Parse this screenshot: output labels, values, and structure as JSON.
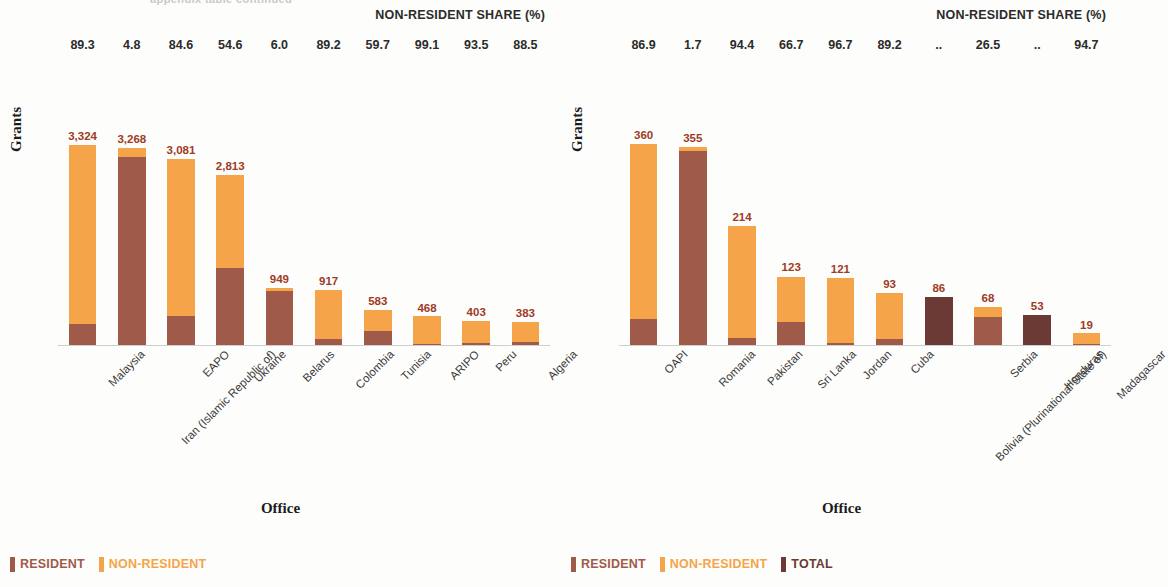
{
  "page": {
    "cutoff_text": "appendix table continued",
    "background": "#fdfdfb"
  },
  "colors": {
    "non_resident": "#f5a44a",
    "resident": "#a05a4a",
    "total": "#6b3a35",
    "value_label": "#9e3b26",
    "header_text": "#2b2b2b",
    "axis_title": "#1c1c1c"
  },
  "charts": [
    {
      "id": "left",
      "share_header": "NON-RESIDENT SHARE (%)",
      "ylabel": "Grants",
      "xlabel": "Office",
      "ymax": 3400,
      "legend": [
        {
          "label": "RESIDENT",
          "color": "#a05a4a"
        },
        {
          "label": "NON-RESIDENT",
          "color": "#f5a44a"
        }
      ],
      "categories": [
        "Malaysia",
        "Iran (Islamic Republic of)",
        "EAPO",
        "Ukraine",
        "Belarus",
        "Colombia",
        "Tunisia",
        "ARIPO",
        "Peru",
        "Algeria"
      ],
      "total_labels": [
        "3,324",
        "3,268",
        "3,081",
        "2,813",
        "949",
        "917",
        "583",
        "468",
        "403",
        "383"
      ],
      "totals": [
        3324,
        3268,
        3081,
        2813,
        949,
        917,
        583,
        468,
        403,
        383
      ],
      "non_resident_share": [
        "89.3",
        "4.8",
        "84.6",
        "54.6",
        "6.0",
        "89.2",
        "59.7",
        "99.1",
        "93.5",
        "88.5"
      ],
      "non_resident": [
        2968,
        157,
        2607,
        1536,
        57,
        818,
        348,
        464,
        377,
        339
      ],
      "resident": [
        356,
        3111,
        474,
        1277,
        892,
        99,
        235,
        4,
        26,
        44
      ],
      "total_only": [
        0,
        0,
        0,
        0,
        0,
        0,
        0,
        0,
        0,
        0
      ]
    },
    {
      "id": "right",
      "share_header": "NON-RESIDENT SHARE (%)",
      "ylabel": "Grants",
      "xlabel": "Office",
      "ymax": 368,
      "legend": [
        {
          "label": "RESIDENT",
          "color": "#a05a4a"
        },
        {
          "label": "NON-RESIDENT",
          "color": "#f5a44a"
        },
        {
          "label": "TOTAL",
          "color": "#6b3a35"
        }
      ],
      "categories": [
        "OAPI",
        "Romania",
        "Pakistan",
        "Sri Lanka",
        "Jordan",
        "Cuba",
        "Bolivia (Plurinational State of)",
        "Serbia",
        "Honduras",
        "Madagascar"
      ],
      "total_labels": [
        "360",
        "355",
        "214",
        "123",
        "121",
        "93",
        "86",
        "68",
        "53",
        "19"
      ],
      "totals": [
        360,
        355,
        214,
        123,
        121,
        93,
        86,
        68,
        53,
        19
      ],
      "non_resident_share": [
        "86.9",
        "1.7",
        "94.4",
        "66.7",
        "96.7",
        "89.2",
        "..",
        "26.5",
        "..",
        "94.7"
      ],
      "non_resident": [
        313,
        6,
        202,
        82,
        117,
        83,
        0,
        18,
        0,
        18
      ],
      "resident": [
        47,
        349,
        12,
        41,
        4,
        10,
        0,
        50,
        0,
        1
      ],
      "total_only": [
        0,
        0,
        0,
        0,
        0,
        0,
        86,
        0,
        53,
        0
      ]
    }
  ],
  "chart_data": {
    "type": "bar",
    "title": "",
    "subtype": "stacked-bar",
    "panels": [
      {
        "name": "left",
        "xlabel": "Office",
        "ylabel": "Grants",
        "ylim": [
          0,
          3400
        ],
        "grid": false,
        "legend_position": "bottom-left",
        "annotation_row": "NON-RESIDENT SHARE (%)",
        "categories": [
          "Malaysia",
          "Iran (Islamic Republic of)",
          "EAPO",
          "Ukraine",
          "Belarus",
          "Colombia",
          "Tunisia",
          "ARIPO",
          "Peru",
          "Algeria"
        ],
        "series": [
          {
            "name": "RESIDENT",
            "values": [
              356,
              3111,
              474,
              1277,
              892,
              99,
              235,
              4,
              26,
              44
            ]
          },
          {
            "name": "NON-RESIDENT",
            "values": [
              2968,
              157,
              2607,
              1536,
              57,
              818,
              348,
              464,
              377,
              339
            ]
          }
        ],
        "totals": [
          3324,
          3268,
          3081,
          2813,
          949,
          917,
          583,
          468,
          403,
          383
        ],
        "non_resident_share_pct": [
          89.3,
          4.8,
          84.6,
          54.6,
          6.0,
          89.2,
          59.7,
          99.1,
          93.5,
          88.5
        ]
      },
      {
        "name": "right",
        "xlabel": "Office",
        "ylabel": "Grants",
        "ylim": [
          0,
          368
        ],
        "grid": false,
        "legend_position": "bottom-left",
        "annotation_row": "NON-RESIDENT SHARE (%)",
        "categories": [
          "OAPI",
          "Romania",
          "Pakistan",
          "Sri Lanka",
          "Jordan",
          "Cuba",
          "Bolivia (Plurinational State of)",
          "Serbia",
          "Honduras",
          "Madagascar"
        ],
        "series": [
          {
            "name": "RESIDENT",
            "values": [
              47,
              349,
              12,
              41,
              4,
              10,
              null,
              50,
              null,
              1
            ]
          },
          {
            "name": "NON-RESIDENT",
            "values": [
              313,
              6,
              202,
              82,
              117,
              83,
              null,
              18,
              null,
              18
            ]
          },
          {
            "name": "TOTAL",
            "values": [
              null,
              null,
              null,
              null,
              null,
              null,
              86,
              null,
              53,
              null
            ]
          }
        ],
        "totals": [
          360,
          355,
          214,
          123,
          121,
          93,
          86,
          68,
          53,
          19
        ],
        "non_resident_share_pct": [
          86.9,
          1.7,
          94.4,
          66.7,
          96.7,
          89.2,
          null,
          26.5,
          null,
          94.7
        ]
      }
    ]
  }
}
